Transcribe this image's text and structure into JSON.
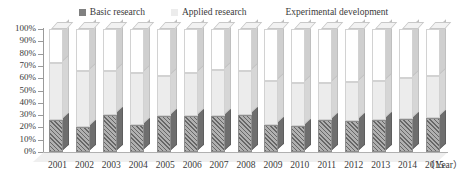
{
  "chart_data": {
    "type": "bar",
    "subtype": "stacked-column-100-percent-3d",
    "title": "",
    "xlabel": "(Year)",
    "ylabel": "",
    "ylim": [
      0,
      100
    ],
    "ytick_labels": [
      "100%",
      "90%",
      "80%",
      "70%",
      "60%",
      "50%",
      "40%",
      "30%",
      "20%",
      "10%",
      "0%"
    ],
    "ytick_values": [
      100,
      90,
      80,
      70,
      60,
      50,
      40,
      30,
      20,
      10,
      0
    ],
    "grid": false,
    "legend_position": "top-center",
    "categories": [
      "2001",
      "2002",
      "2003",
      "2004",
      "2005",
      "2006",
      "2007",
      "2008",
      "2009",
      "2010",
      "2011",
      "2012",
      "2013",
      "2014",
      "2015"
    ],
    "series": [
      {
        "name": "Basic research",
        "color": "#9e9e9e",
        "pattern": "diagonal-hatch",
        "values": [
          26,
          20,
          30,
          22,
          29,
          29,
          29,
          30,
          22,
          21,
          26,
          25,
          26,
          27,
          28
        ]
      },
      {
        "name": "Applied research",
        "color": "#ececec",
        "pattern": "solid",
        "values": [
          46,
          46,
          36,
          42,
          33,
          35,
          38,
          36,
          36,
          35,
          30,
          32,
          32,
          33,
          34
        ]
      },
      {
        "name": "Experimental development",
        "color": "#ffffff",
        "pattern": "solid",
        "values": [
          28,
          34,
          34,
          36,
          38,
          36,
          33,
          34,
          42,
          44,
          44,
          43,
          42,
          40,
          38
        ]
      }
    ]
  },
  "legend": {
    "items": [
      {
        "label": "Basic research",
        "color": "#808080"
      },
      {
        "label": "Applied research",
        "color": "#ececec"
      },
      {
        "label": "Experimental development",
        "color": "#ffffff"
      }
    ]
  },
  "axis": {
    "x_title": "（Year）"
  }
}
